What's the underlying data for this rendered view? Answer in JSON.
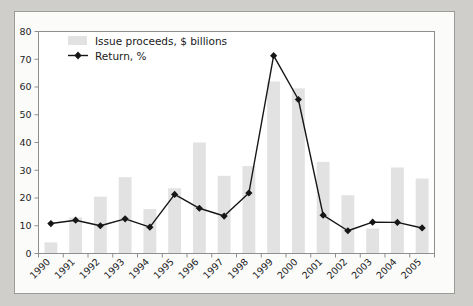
{
  "chart_data": {
    "type": "bar",
    "title": "",
    "subtitle": "",
    "xlabel": "",
    "ylabel": "",
    "ylim": [
      0,
      80
    ],
    "yticks": [
      0,
      10,
      20,
      30,
      40,
      50,
      60,
      70,
      80
    ],
    "grid": false,
    "legend_position": "top-left",
    "categories": [
      "1990",
      "1991",
      "1992",
      "1993",
      "1994",
      "1995",
      "1996",
      "1997",
      "1998",
      "1999",
      "2000",
      "2001",
      "2002",
      "2003",
      "2004",
      "2005"
    ],
    "series": [
      {
        "name": "Issue proceeds, $ billions",
        "type": "bar",
        "color": "#e2e2e2",
        "values": [
          4,
          13,
          20.5,
          27.5,
          16,
          23.5,
          40,
          28,
          31.5,
          62,
          59.5,
          33,
          21,
          9,
          31,
          27
        ]
      },
      {
        "name": "Return, %",
        "type": "line",
        "color": "#161616",
        "marker": "diamond",
        "values": [
          10.8,
          12,
          10,
          12.5,
          9.5,
          21.3,
          16.3,
          13.5,
          21.8,
          71.3,
          55.5,
          13.8,
          8.2,
          11.3,
          11.2,
          9.2
        ]
      }
    ]
  },
  "legend": {
    "items": [
      {
        "label": "Issue proceeds, $ billions",
        "marker": "bar-swatch"
      },
      {
        "label": "Return, %",
        "marker": "line-diamond"
      }
    ]
  },
  "axes": {
    "y_tick_labels": [
      "80",
      "70",
      "60",
      "50",
      "40",
      "30",
      "20",
      "10",
      "0"
    ],
    "x_tick_labels": [
      "1990",
      "1991",
      "1992",
      "1993",
      "1994",
      "1995",
      "1996",
      "1997",
      "1998",
      "1999",
      "2000",
      "2001",
      "2002",
      "2003",
      "2004",
      "2005"
    ]
  },
  "colors": {
    "page_background": "#cfcecb",
    "paper": "#fbfbfa",
    "paper_border": "#9b9b99",
    "plot_frame": "#8f8f8f",
    "bar_fill": "#e2e2e2",
    "line": "#161616",
    "text": "#1d1d1d"
  }
}
